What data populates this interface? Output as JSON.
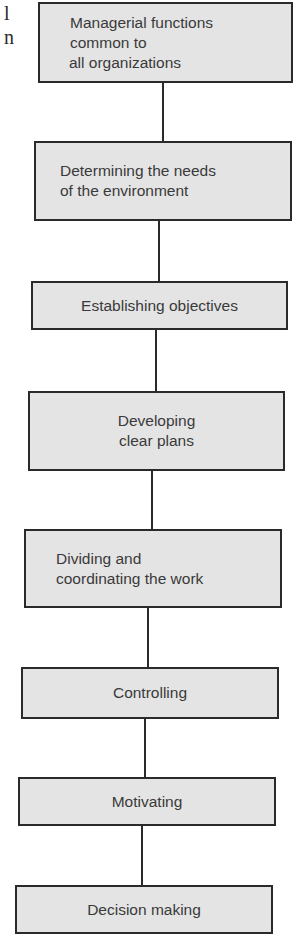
{
  "page_fragment": {
    "edge_letters": [
      "l",
      "n"
    ]
  },
  "flowchart": {
    "title_box": {
      "lines": [
        "Managerial functions",
        "common to",
        "all organizations"
      ]
    },
    "steps": [
      {
        "lines": [
          "Determining the needs",
          "of the environment"
        ]
      },
      {
        "lines": [
          "Establishing objectives"
        ]
      },
      {
        "lines": [
          "Developing",
          "clear plans"
        ]
      },
      {
        "lines": [
          "Dividing and",
          "coordinating the work"
        ]
      },
      {
        "lines": [
          "Controlling"
        ]
      },
      {
        "lines": [
          "Motivating"
        ]
      },
      {
        "lines": [
          "Decision making"
        ]
      }
    ]
  },
  "colors": {
    "box_fill": "#e4e4e4",
    "box_border": "#2a2a2a",
    "text": "#3a3a3a"
  }
}
